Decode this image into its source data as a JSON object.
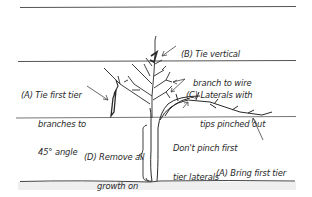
{
  "diagram": {
    "kind": "pruning-and-training-illustration",
    "colors": {
      "ink": "#2a2a2a",
      "wire": "#555555",
      "ground_shade": "#eeeeee",
      "background": "#ffffff"
    },
    "wires": [
      {
        "name": "top-wire",
        "y": 7
      },
      {
        "name": "middle-wire",
        "y": 61
      },
      {
        "name": "bottom-wire",
        "y": 118
      }
    ],
    "ground_y": 182,
    "annotations": {
      "b": {
        "line1": "(B) Tie vertical",
        "line2": "branch to wire"
      },
      "a_left": {
        "line1": "(A) Tie first tier",
        "line2": "branches to",
        "line3": "45° angle"
      },
      "c": {
        "line1": "(C) Laterals with",
        "line2": "tips pinched out"
      },
      "d": {
        "line1": "(D) Remove all",
        "line2": "growth on",
        "line3": "trunk"
      },
      "dont_pinch": {
        "line1": "Don't pinch first",
        "line2": "tier laterals"
      },
      "a_right": {
        "line1": "(A) Bring first tier",
        "line2": "branch into position"
      }
    }
  }
}
